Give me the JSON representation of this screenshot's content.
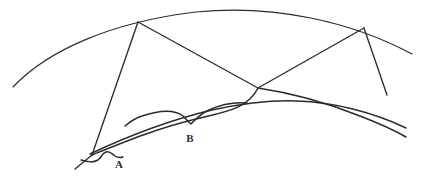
{
  "figure": {
    "kind": "hand-drawn-geometric-diagram",
    "background_color": "#ffffff",
    "ink_color": "#2b2b2b",
    "width": 426,
    "height": 180,
    "labels": [
      {
        "id": "A",
        "text": "A",
        "x": 119,
        "y": 168
      },
      {
        "id": "B",
        "text": "B",
        "x": 190,
        "y": 142
      }
    ],
    "braces": [
      {
        "id": "brace-a",
        "measures_label": "A",
        "path": "M 81 160 C 88 162 93 163 98 160 C 101 158 102 153 106 152 C 110 151 112 154 115 156 C 118 158 120 158 123 157"
      },
      {
        "id": "brace-b",
        "measures_label": "B",
        "path": "M 125 126 C 131 121 135 118 142 116 C 160 110 174 109 183 116 C 186 119 188 122 191 124 C 195 120 200 114 209 110 C 222 104 236 102 247 103"
      }
    ],
    "arcs": [
      {
        "id": "outer-arc",
        "description": "large upper circular arc spanning full width",
        "path": "M 13 87 C 48 50 112 22 196 12 C 274 4 352 22 412 54"
      },
      {
        "id": "inner-arc-upper",
        "description": "upper edge of the thin lens region",
        "path": "M 90 154 C 128 136 170 120 212 110 C 240 104 272 100 297 101 C 334 102 375 113 406 128"
      },
      {
        "id": "inner-arc-lower",
        "description": "lower edge of the thin lens region meeting vertex at left",
        "path": "M 92 155 C 124 142 158 128 196 119 C 224 112 248 109 258 88"
      },
      {
        "id": "lower-arc-right",
        "description": "arc continuing right from the centre vertex",
        "path": "M 258 88 C 292 93 330 104 360 116 C 378 123 394 130 406 137"
      }
    ],
    "segments": [
      {
        "id": "spoke-apex-to-left-vertex",
        "x1": 138,
        "y1": 22,
        "x2": 92,
        "y2": 155
      },
      {
        "id": "spoke-apex-to-centre-vertex",
        "x1": 138,
        "y1": 22,
        "x2": 258,
        "y2": 88
      },
      {
        "id": "spoke-centre-vertex-to-right-vertex",
        "x1": 258,
        "y1": 88,
        "x2": 364,
        "y2": 28
      },
      {
        "id": "spoke-right-vertex-down",
        "x1": 364,
        "y1": 28,
        "x2": 387,
        "y2": 95
      },
      {
        "id": "tail-below-left-vertex",
        "x1": 92,
        "y1": 155,
        "x2": 75,
        "y2": 169
      }
    ],
    "vertices": [
      {
        "id": "apex-vertex",
        "x": 138,
        "y": 22
      },
      {
        "id": "centre-vertex",
        "x": 258,
        "y": 88
      },
      {
        "id": "right-vertex",
        "x": 364,
        "y": 28
      },
      {
        "id": "left-vertex",
        "x": 92,
        "y": 155
      }
    ]
  }
}
